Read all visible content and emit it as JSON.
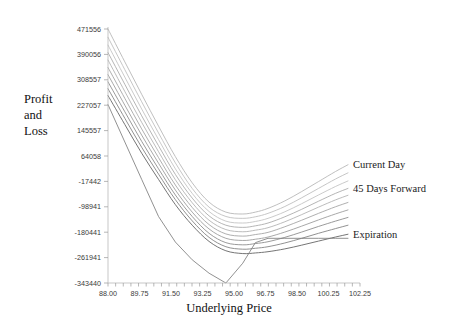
{
  "chart_data": {
    "type": "line",
    "title": "",
    "xlabel": "Underlying Price",
    "ylabel": "Profit and Loss",
    "ylabel_lines": [
      "Profit",
      "and",
      "Loss"
    ],
    "xlim": [
      88.0,
      102.25
    ],
    "ylim": [
      -343440,
      471556
    ],
    "grid": false,
    "legend_position": "right-inline",
    "xticks": [
      88.0,
      89.75,
      91.5,
      93.25,
      95.0,
      96.75,
      98.5,
      100.25,
      102.25
    ],
    "xtick_labels": [
      "88.00",
      "89.75",
      "91.50",
      "93.25",
      "95.00",
      "96.75",
      "98.50",
      "100.25",
      "102.25"
    ],
    "yticks": [
      471556,
      390056,
      308557,
      227057,
      145557,
      64058,
      -17442,
      -98941,
      -180441,
      -261941,
      -343440
    ],
    "ytick_labels": [
      "471556",
      "390056",
      "308557",
      "227057",
      "145557",
      "64058",
      "-17442",
      "-98941",
      "-180441",
      "-261941",
      "-343440"
    ],
    "legend": [
      "Current Day",
      "45 Days Forward",
      "Expiration"
    ],
    "x": [
      88.0,
      89.0,
      90.0,
      91.0,
      92.0,
      93.0,
      94.0,
      95.0,
      96.0,
      96.75,
      97.5,
      98.5,
      99.5,
      100.5,
      101.5,
      102.25
    ],
    "series": [
      {
        "name": "Current Day",
        "label": "Current Day",
        "labeled": true,
        "color": "#b4b4b4",
        "width": 0.85,
        "values": [
          471556,
          366000,
          262000,
          160000,
          62000,
          -22000,
          -84000,
          -116000,
          -122000,
          -116000,
          -104000,
          -80000,
          -50000,
          -18000,
          14000,
          36000
        ]
      },
      {
        "name": "day-2",
        "label": "",
        "labeled": false,
        "color": "#bcbcbc",
        "width": 0.85,
        "values": [
          445000,
          341000,
          238000,
          138000,
          42000,
          -40000,
          -100000,
          -130000,
          -136000,
          -131000,
          -120000,
          -98000,
          -70000,
          -40000,
          -10000,
          10000
        ]
      },
      {
        "name": "day-3",
        "label": "",
        "labeled": false,
        "color": "#c0c0c0",
        "width": 0.85,
        "values": [
          420000,
          317000,
          215000,
          117000,
          23000,
          -56000,
          -114000,
          -145000,
          -151000,
          -146000,
          -136000,
          -115000,
          -89000,
          -61000,
          -34000,
          -16000
        ]
      },
      {
        "name": "45 Days Forward",
        "label": "45 Days Forward",
        "labeled": true,
        "color": "#a8a8a8",
        "width": 0.85,
        "values": [
          396000,
          294000,
          193000,
          97000,
          5000,
          -71000,
          -128000,
          -158000,
          -165000,
          -160000,
          -151000,
          -131000,
          -107000,
          -81000,
          -56000,
          -40000
        ]
      },
      {
        "name": "day-5",
        "label": "",
        "labeled": false,
        "color": "#b0b0b0",
        "width": 0.85,
        "values": [
          372000,
          271000,
          172000,
          78000,
          -12000,
          -86000,
          -142000,
          -172000,
          -179000,
          -174000,
          -166000,
          -147000,
          -124000,
          -100000,
          -77000,
          -62000
        ]
      },
      {
        "name": "day-6",
        "label": "",
        "labeled": false,
        "color": "#a0a0a0",
        "width": 0.85,
        "values": [
          348000,
          249000,
          151000,
          59000,
          -29000,
          -101000,
          -156000,
          -186000,
          -193000,
          -188000,
          -181000,
          -163000,
          -142000,
          -120000,
          -99000,
          -85000
        ]
      },
      {
        "name": "day-7",
        "label": "",
        "labeled": false,
        "color": "#989898",
        "width": 0.85,
        "values": [
          325000,
          227000,
          131000,
          41000,
          -45000,
          -116000,
          -170000,
          -200000,
          -207000,
          -203000,
          -196000,
          -180000,
          -161000,
          -141000,
          -122000,
          -109000
        ]
      },
      {
        "name": "day-8",
        "label": "",
        "labeled": false,
        "color": "#8e8e8e",
        "width": 0.9,
        "values": [
          302000,
          206000,
          111000,
          23000,
          -61000,
          -130000,
          -184000,
          -214000,
          -221000,
          -217000,
          -211000,
          -197000,
          -180000,
          -162000,
          -145000,
          -133000
        ]
      },
      {
        "name": "day-9",
        "label": "",
        "labeled": false,
        "color": "#858585",
        "width": 0.9,
        "values": [
          280000,
          185000,
          92000,
          6000,
          -76000,
          -144000,
          -197000,
          -227000,
          -235000,
          -232000,
          -227000,
          -215000,
          -200000,
          -184000,
          -169000,
          -158000
        ]
      },
      {
        "name": "Expiration",
        "label": "Expiration",
        "labeled": true,
        "color": "#6e6e6e",
        "width": 0.95,
        "values": [
          258000,
          165000,
          73000,
          -11000,
          -92000,
          -158000,
          -210000,
          -240000,
          -249000,
          -247000,
          -243000,
          -234000,
          -222000,
          -209000,
          -196000,
          -187000
        ]
      },
      {
        "name": "Expiration-payoff",
        "label": "",
        "labeled": false,
        "color": "#7d7d7d",
        "width": 0.85,
        "is_payoff": true,
        "values": [
          229000,
          109000,
          -11000,
          -130000,
          -212000,
          -269000,
          -312000,
          -343440,
          -280000,
          -214000,
          -200000,
          -200000,
          -200000,
          -200000,
          -200000,
          -200000
        ]
      }
    ]
  }
}
